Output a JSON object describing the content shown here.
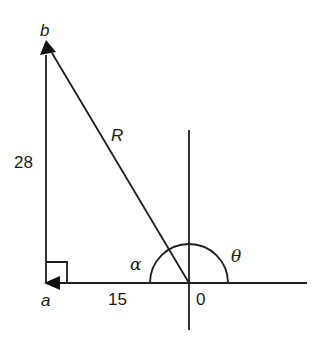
{
  "diagram": {
    "type": "vector-triangle",
    "points": {
      "a": {
        "label": "a"
      },
      "b": {
        "label": "b"
      },
      "origin": {
        "label": "0"
      }
    },
    "sides": {
      "vertical": {
        "label": "28"
      },
      "horizontal": {
        "label": "15"
      },
      "resultant": {
        "label": "R"
      }
    },
    "angles": {
      "alpha": {
        "label": "α"
      },
      "theta": {
        "label": "θ"
      }
    },
    "right_angle_at": "a",
    "colors": {
      "stroke": "#1f1f1f",
      "background": "#ffffff"
    }
  }
}
